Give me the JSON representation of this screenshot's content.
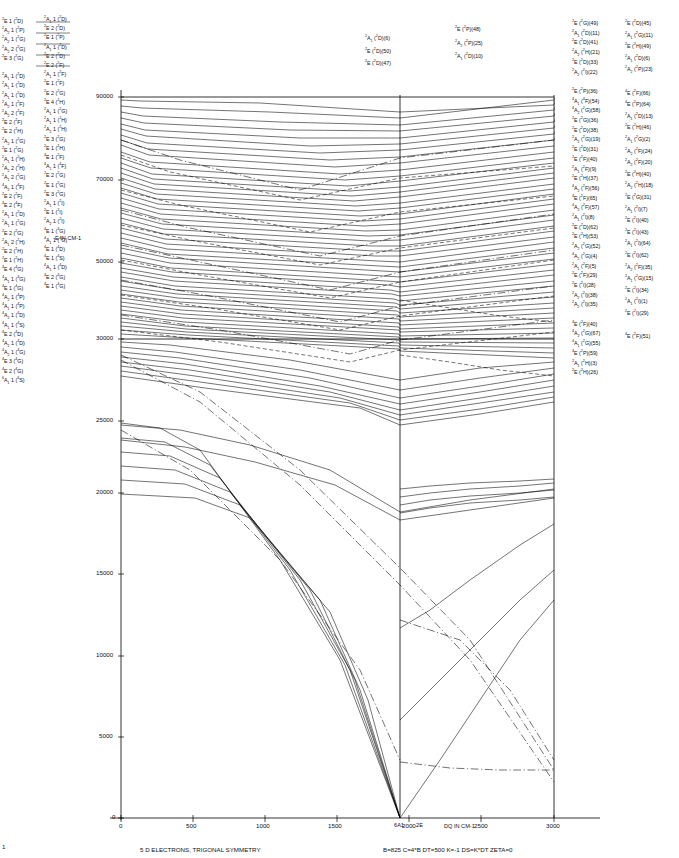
{
  "figure": {
    "caption_left": "5 D ELECTRONS, TRIGONAL SYMMETRY",
    "caption_right": "B=825   C=4*B   DT=500   K=-1   DS=K*DT   ZETA=0",
    "y_axis_label": "E IN CM-1",
    "x_axis_label": "DQ IN CM-1"
  },
  "chart_data": {
    "type": "line",
    "title": "5 D ELECTRONS, TRIGONAL SYMMETRY",
    "xlabel": "DQ IN CM-1",
    "ylabel": "E IN CM-1",
    "xlim": [
      0,
      3100
    ],
    "ylim": [
      0,
      90000
    ],
    "grid": false,
    "legend_position": "none",
    "xticks": [
      0,
      500,
      1000,
      1500,
      2000,
      2500,
      3000
    ],
    "xtick_labels": [
      "0",
      "500",
      "1000",
      "1500",
      "2000",
      "2500",
      "3000"
    ],
    "yticks": [
      0,
      5000,
      10000,
      15000,
      20000,
      25000,
      30000,
      50000,
      70000,
      90000
    ],
    "ytick_labels": [
      "0",
      "5000",
      "10000",
      "15000",
      "20000",
      "25000",
      "30000",
      "50000",
      "70000",
      "90000"
    ],
    "y_axis_note": "axis is linear 0-30000 then compressed 30000-90000",
    "parameters": {
      "B": 825,
      "C": "4*B",
      "DT": 500,
      "K": -1,
      "DS": "K*DT",
      "ZETA": 0
    },
    "ground_state_crossing": {
      "dq": 1850,
      "labels": [
        "6A1",
        "2E"
      ],
      "note": "high-spin to low-spin crossover"
    },
    "series_note": "Each curve is one crystal-field energy level of a d5 ion in trigonal symmetry, traced from DQ=0 (free-ion-like manifold, left labels) to DQ=3000 (right labels). Solid, dashed and dash-dot strokes distinguish level families."
  },
  "left_labels_col1": [
    "2E 1(2D)",
    "2A2 1(2P)",
    "2A2 1(2G)",
    "2A2 2(2G)",
    "2E 3(2G)",
    "",
    "2A1 1(2D)",
    "2A1 1(2D)",
    "2A1 1(2D)",
    "2A2 1(2F)",
    "2A2 2(2F)",
    "2E 2(2F)",
    "2E 2(2H)",
    "2A2 1(2G)",
    "2E 1(2G)",
    "2A1 1(2H)",
    "2A2 2(2H)",
    "2A1 2(2G)",
    "4A2 1(4F)",
    "2E 2(2F)",
    "4E 2(4F)",
    "2A1 1(2D)",
    "2A1 1(2G)",
    "2E 2(2G)",
    "2A1 2(2H)",
    "2E 2(2H)",
    "2E 1(2H)",
    "4E 4(4G)",
    "4A1 1(4G)",
    "4E 1(4G)",
    "4A2 1(4P)",
    "4A1 1(4P)",
    "4A2 1(4D)",
    "4A1 1(4S)",
    "4E 2(4D)",
    "4A2 1(4D)",
    "4A2 1(4G)",
    "4E 3(4G)",
    "4E 2(4G)",
    "6A1 1(6S)"
  ],
  "left_labels_col2": [
    "2A1 1(2D)",
    "2E 2(2D)",
    "2E 1(2P)",
    "2A1 1(2D)",
    "2E 2(2D)",
    "2E 2(2F)",
    "2A1 1(2F)",
    "2E 1(2F)",
    "2E 2(2G)",
    "2E 4(2H)",
    "2A1 1(2G)",
    "2A1 1(2H)",
    "2A2 1(2H)",
    "2E 3(2G)",
    "2E 1(2H)",
    "4E 1(2F)",
    "4A1 1(4F)",
    "2E 2(2G)",
    "2E 1(2G)",
    "2E 3(2G)",
    "2A1 1(2I)",
    "2E 1(2I)",
    "2A2 1(2I)",
    "4E 1(4G)",
    "4A1 1(4G)",
    "4E 1(4D)",
    "4E 1(4S)",
    "4A1 1(4D)",
    "4E 2(4G)",
    "4E 1(4G)"
  ],
  "top_labels": [
    {
      "text": "2A1 (2D)(6)",
      "x": 365,
      "y": 33
    },
    {
      "text": "2E (2D)(50)",
      "x": 365,
      "y": 46
    },
    {
      "text": "2E (2D)(47)",
      "x": 365,
      "y": 58
    },
    {
      "text": "2E (2P)(48)",
      "x": 455,
      "y": 24
    },
    {
      "text": "2A2 (2P)(25)",
      "x": 455,
      "y": 38
    },
    {
      "text": "2A1 (2D)(10)",
      "x": 455,
      "y": 51
    }
  ],
  "right_labels_col1": [
    "2E  (2G)(49)",
    "2A1 (2D)(11)",
    "2E  (2D)(41)",
    "2A2 (2H)(21)",
    "2E  (2D)(33)",
    "2A2 (2I)(22)",
    "",
    "2E  (2P)(36)",
    "4A1 (4F)(54)",
    "4A2 (2G)(58)",
    "2E  (2G)(36)",
    "2E  (2D)(38)",
    "2A2 (2G)(19)",
    "2E  (2D)(31)",
    "2E  (2F)(40)",
    "2A1 (2F)(9)",
    "2E  (2H)(37)",
    "4A2 (2F)(56)",
    "4E  (2F)(65)",
    "4A2 (2F)(57)",
    "2A1 (2I)(8)",
    "2E  (2D)(62)",
    "2E  (2H)(53)",
    "2A2 (2G)(52)",
    "4A2 (2G)(4)",
    "2A1 (2F)(5)",
    "2E  (2F)(29)",
    "2E  (2I)(28)",
    "2A2 (2I)(38)",
    "2A2 (2I)(35)",
    "",
    "4E  (2F)(40)",
    "4A2 (2G)(67)",
    "4A1 (2G)(55)",
    "4E  (2P)(59)",
    "2A1 (2H)(3)",
    "2E  (2H)(26)"
  ],
  "right_labels_col2": [
    "2E  (2D)(45)",
    "2A1 (2G)(11)",
    "2E  (2H)(49)",
    "2A1 (2D)(6)",
    "2A2 (2P)(23)",
    "",
    "4E  (2F)(66)",
    "4E  (2P)(64)",
    "2A1 (2D)(13)",
    "2E  (2H)(46)",
    "2A1 (2G)(2)",
    "2A2 (2F)(24)",
    "2A2 (2F)(20)",
    "2E  (2H)(40)",
    "2A2 (2H)(18)",
    "2E  (2G)(31)",
    "2A1 (2I)(7)",
    "2E  (2I)(40)",
    "2E  (2I)(43)",
    "2A1 (2I)(64)",
    "2E  (2I)(62)",
    "2A2 (2F)(35)",
    "2A1 (2G)(15)",
    "2E  (2I)(34)",
    "2A1 (2I)(1)",
    "2E  (2I)(29)",
    "",
    "4E  (2F)(51)"
  ],
  "ground_labels": [
    {
      "text": "6A1",
      "x": 398,
      "y": 825
    },
    {
      "text": "2E",
      "x": 419,
      "y": 825
    }
  ],
  "corner_mark": "1"
}
